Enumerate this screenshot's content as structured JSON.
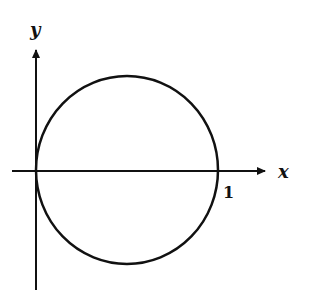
{
  "diagram": {
    "type": "coordinate-plot",
    "axes": {
      "x_label": "x",
      "y_label": "y"
    },
    "annotations": {
      "x_intercept_label": "1"
    },
    "curve": {
      "shape": "circle",
      "center": [
        0.5,
        0
      ],
      "radius": 0.5
    },
    "colors": {
      "stroke": "#111111",
      "background": "#ffffff"
    }
  }
}
